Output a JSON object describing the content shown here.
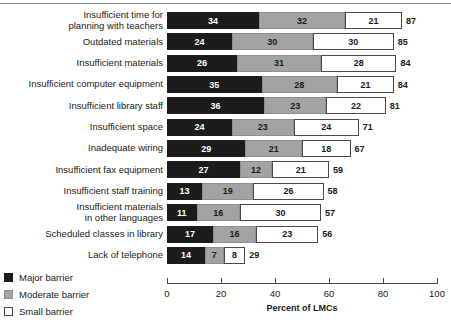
{
  "chart_data": {
    "type": "bar",
    "subtype": "horizontal-stacked",
    "title": "",
    "xlabel": "Percent of LMCs",
    "ylabel": "",
    "xlim": [
      0,
      100
    ],
    "grid": false,
    "legend_position": "bottom-left",
    "categories": [
      "Insufficient time for\nplanning with teachers",
      "Outdated materials",
      "Insufficient materials",
      "Insufficient computer equipment",
      "Insufficient library staff",
      "Insufficient space",
      "Inadequate wiring",
      "Insufficient fax equipment",
      "Insufficient staff training",
      "Insufficient materials\nin other languages",
      "Scheduled classes in library",
      "Lack of telephone"
    ],
    "series": [
      {
        "name": "Major barrier",
        "color": "#1c1c1c",
        "values": [
          34,
          24,
          26,
          35,
          36,
          24,
          29,
          27,
          13,
          11,
          17,
          14
        ]
      },
      {
        "name": "Moderate barrier",
        "color": "#a3a3a3",
        "values": [
          32,
          30,
          31,
          28,
          23,
          23,
          21,
          12,
          19,
          16,
          16,
          7
        ]
      },
      {
        "name": "Small barrier",
        "color": "#ffffff",
        "values": [
          21,
          30,
          28,
          21,
          22,
          24,
          18,
          21,
          26,
          30,
          23,
          8
        ]
      }
    ],
    "totals": [
      87,
      85,
      84,
      84,
      81,
      71,
      67,
      59,
      58,
      57,
      56,
      29
    ],
    "xticks": [
      0,
      20,
      40,
      60,
      80,
      100
    ],
    "xticklabels": [
      "0",
      "20",
      "40",
      "60",
      "80",
      "100"
    ]
  },
  "legend": {
    "items": [
      {
        "label": "Major barrier",
        "swatch": "swatch-major-icon"
      },
      {
        "label": "Moderate barrier",
        "swatch": "swatch-moderate-icon"
      },
      {
        "label": "Small barrier",
        "swatch": "swatch-small-icon"
      }
    ]
  }
}
